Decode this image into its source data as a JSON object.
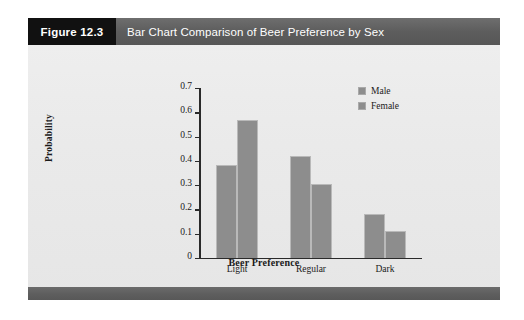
{
  "figure": {
    "number_label": "Figure 12.3",
    "title": "Bar Chart Comparison of Beer Preference by Sex"
  },
  "chart_data": {
    "type": "bar",
    "title": "Bar Chart Comparison of Beer Preference by Sex",
    "categories": [
      "Light",
      "Regular",
      "Dark"
    ],
    "series": [
      {
        "name": "Male",
        "values": [
          0.385,
          0.42,
          0.18
        ]
      },
      {
        "name": "Female",
        "values": [
          0.57,
          0.305,
          0.11
        ]
      }
    ],
    "xlabel": "Beer Preference",
    "ylabel": "Probability",
    "ylim": [
      0,
      0.7
    ],
    "ytick_labels": [
      "0",
      "0.1",
      "0.2",
      "0.3",
      "0.4",
      "0.5",
      "0.6",
      "0.7"
    ],
    "ytick_values": [
      0,
      0.1,
      0.2,
      0.3,
      0.4,
      0.5,
      0.6,
      0.7
    ],
    "grid": false,
    "legend_position": "top-right",
    "bar_color": "#8d8d8d",
    "bar_edge_color": "#b9b9b9"
  },
  "colors": {
    "panel_background": "#eaeaea",
    "header_dark": "#111111",
    "header_gray": "#5d5d5d",
    "footer_gray": "#5e5e5e",
    "axis": "#2a2a2a"
  }
}
